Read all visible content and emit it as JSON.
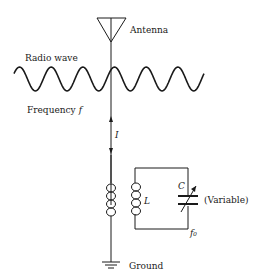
{
  "diagram": {
    "type": "circuit",
    "labels": {
      "antenna": "Antenna",
      "radio_wave": "Radio wave",
      "frequency": "Frequency",
      "frequency_symbol": "f",
      "current": "I",
      "inductor": "L",
      "capacitor": "C",
      "capacitor_note": "(Variable)",
      "resonant_frequency": "f₀",
      "ground": "Ground"
    },
    "components": [
      {
        "id": "antenna",
        "label": "Antenna"
      },
      {
        "id": "primary-coil",
        "label": ""
      },
      {
        "id": "secondary-coil",
        "label": "L"
      },
      {
        "id": "variable-capacitor",
        "label": "C (Variable)"
      },
      {
        "id": "ground",
        "label": "Ground"
      }
    ],
    "wave": {
      "cycles": 6
    }
  }
}
